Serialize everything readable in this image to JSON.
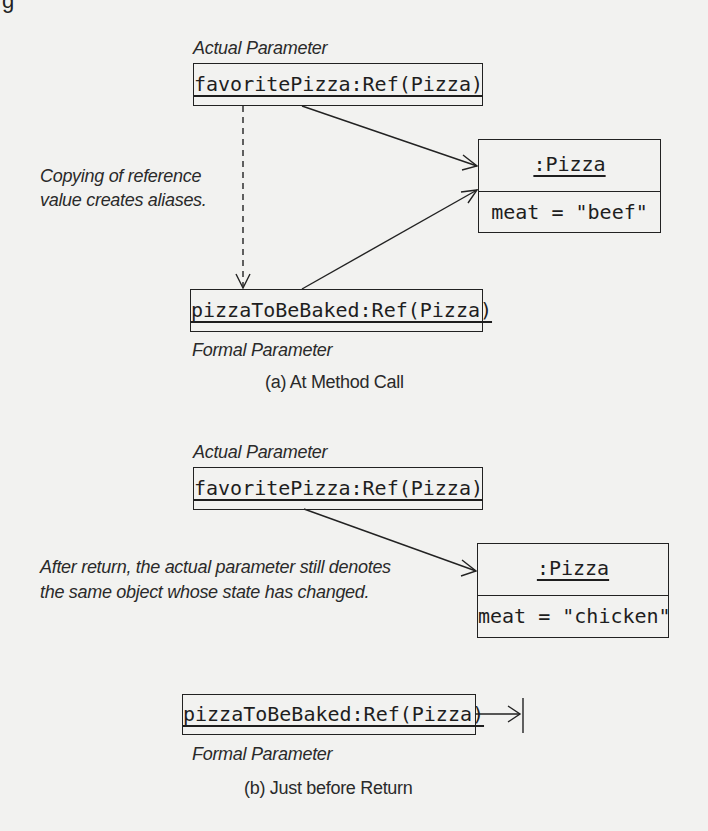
{
  "figure": {
    "partial_heading_glyph": "g",
    "panel_a": {
      "caption": "(a) At Method Call",
      "actual_parameter_label": "Actual Parameter",
      "actual_parameter_box": "favoritePizza:Ref(Pizza)",
      "formal_parameter_label": "Formal Parameter",
      "formal_parameter_box": "pizzaToBeBaked:Ref(Pizza)",
      "note": [
        "Copying of reference",
        "value creates aliases."
      ],
      "object": {
        "name": ":Pizza",
        "attribute": "meat = \"beef\""
      }
    },
    "panel_b": {
      "caption": "(b) Just before Return",
      "actual_parameter_label": "Actual Parameter",
      "actual_parameter_box": "favoritePizza:Ref(Pizza)",
      "formal_parameter_label": "Formal Parameter",
      "formal_parameter_box": "pizzaToBeBaked:Ref(Pizza)",
      "note": [
        "After return, the actual parameter still denotes",
        "the same object whose state has changed."
      ],
      "object": {
        "name": ":Pizza",
        "attribute": "meat = \"chicken\""
      }
    },
    "colors": {
      "ink": "#1e1e1e",
      "background": "#f2f2f0"
    }
  }
}
